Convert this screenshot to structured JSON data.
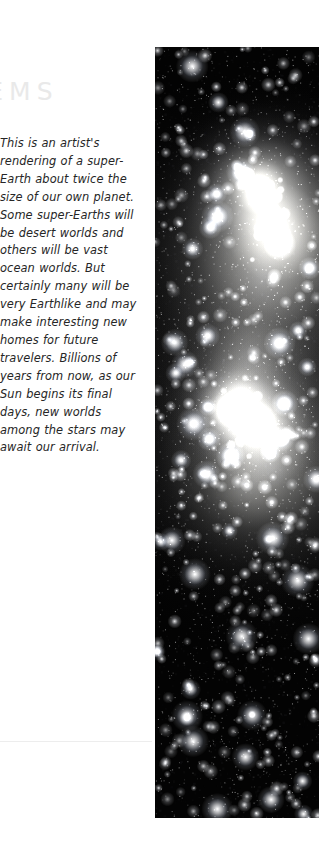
{
  "page": {
    "background_color": "#ffffff",
    "width": 319,
    "height": 861
  },
  "heading": {
    "text": "TEMS",
    "full_word_guess": "SYSTEMS",
    "color": "#e9e9e9",
    "clipped_left": true
  },
  "body": {
    "caption": "This is an artist's rendering of a super-Earth about twice the size of our own planet. Some super-Earths will be desert worlds and others will be vast ocean worlds. But certainly many will be very Earthlike and may make interesting new homes for future travelers. Billions of years from now, as our Sun begins its final days, new worlds among the stars may await our arrival.",
    "lines": [
      "This is an artist's",
      "rendering of a super-",
      "Earth about twice the",
      "size of our own planet.",
      "Some super-Earths will",
      "be desert worlds and",
      "others will be vast ocean",
      "worlds. But certainly",
      "many will be very",
      "Earthlike and may make",
      "interesting new homes",
      "for future travelers.",
      "Billions of years from",
      "now, as our Sun begins",
      "its final days, new",
      "worlds among the stars",
      "may await our arrival."
    ],
    "text_color": "#262626"
  },
  "divider": {
    "color": "#ededed"
  },
  "photo": {
    "name": "starfield-nebula-photo",
    "description": "Deep-space starfield photograph with two large bright glowing nebula orbs in the upper half and dense scattered stars throughout",
    "background_color": "#030303",
    "glow_color": "#ffffff",
    "glows": [
      {
        "cx": 74,
        "cy": 24,
        "r": 19,
        "peak": 0.95
      },
      {
        "cx": 63,
        "cy": 18,
        "r": 11,
        "peak": 1.0
      },
      {
        "cx": 66,
        "cy": 30,
        "r": 27,
        "peak": 0.34
      },
      {
        "cx": 58,
        "cy": 40,
        "r": 17,
        "peak": 0.3
      },
      {
        "cx": 52,
        "cy": 45,
        "r": 10,
        "peak": 0.42
      },
      {
        "cx": 44,
        "cy": 47,
        "r": 7,
        "peak": 0.82
      },
      {
        "cx": 62,
        "cy": 49,
        "r": 9,
        "peak": 0.95
      },
      {
        "cx": 63,
        "cy": 50,
        "r": 22,
        "peak": 0.5
      },
      {
        "cx": 72,
        "cy": 55,
        "r": 24,
        "peak": 0.28
      },
      {
        "cx": 55,
        "cy": 57,
        "r": 16,
        "peak": 0.22
      }
    ]
  }
}
